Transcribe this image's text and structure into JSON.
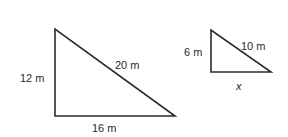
{
  "diagram": {
    "type": "similar-right-triangles",
    "stroke_color": "#2b2b2b",
    "large_triangle": {
      "left_side": "12 m",
      "hypotenuse": "20 m",
      "bottom_side": "16 m"
    },
    "small_triangle": {
      "left_side": "6 m",
      "hypotenuse": "10 m",
      "bottom_side": "x"
    }
  }
}
